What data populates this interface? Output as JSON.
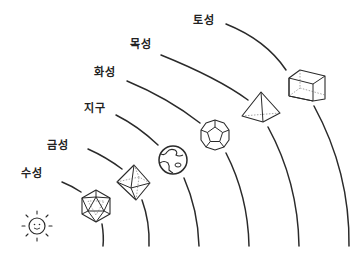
{
  "diagram": {
    "title": "",
    "sun": {
      "icon": "sun-icon",
      "face": "smiling"
    },
    "planets": [
      {
        "name": "수성",
        "solid": "정이십면체"
      },
      {
        "name": "금성",
        "solid": "정팔면체"
      },
      {
        "name": "지구",
        "solid": "지구"
      },
      {
        "name": "화성",
        "solid": "정십이면체"
      },
      {
        "name": "목성",
        "solid": "정사면체"
      },
      {
        "name": "토성",
        "solid": "정육면체"
      }
    ],
    "colors": {
      "line": "#2a2a2a",
      "background": "#ffffff",
      "text": "#222222"
    }
  }
}
